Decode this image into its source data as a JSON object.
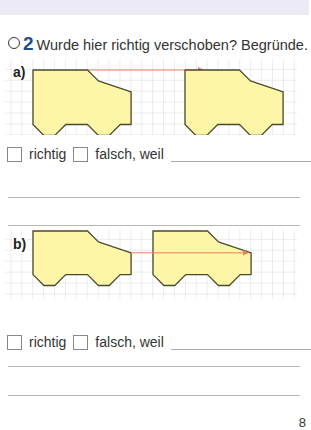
{
  "task": {
    "number": "2",
    "instruction": "Wurde hier richtig verschoben? Begründe."
  },
  "parts": [
    {
      "label": "a)",
      "options": {
        "correct": "richtig",
        "wrong": "falsch, weil"
      }
    },
    {
      "label": "b)",
      "options": {
        "correct": "richtig",
        "wrong": "falsch, weil"
      }
    }
  ],
  "colors": {
    "car_fill": "#fdf6a6",
    "car_stroke": "#4a4a30",
    "arrow": "#f08060",
    "grid": "#cfcfcf",
    "task_number": "#1f4e8c",
    "top_band": "#ecebf5"
  },
  "page_number": "8"
}
